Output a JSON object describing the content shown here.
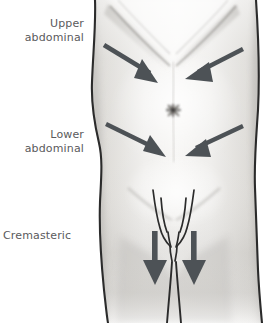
{
  "figure": {
    "background_color": "#ffffff",
    "width": 266,
    "height": 323
  },
  "labels": {
    "upper_abdominal": "Upper\nabdominal",
    "lower_abdominal": "Lower\nabdominal",
    "cremasteric": "Cremasteric",
    "text_color": "#5a5a5c"
  },
  "arrows": {
    "color": "#4d5256",
    "items": [
      {
        "name": "upper-abdominal-left-arrow",
        "direction": "down-right",
        "tail": [
          104,
          45
        ],
        "tip": [
          158,
          83
        ]
      },
      {
        "name": "upper-abdominal-right-arrow",
        "direction": "down-left",
        "tail": [
          243,
          49
        ],
        "tip": [
          186,
          79
        ]
      },
      {
        "name": "lower-abdominal-left-arrow",
        "direction": "down-right",
        "tail": [
          106,
          124
        ],
        "tip": [
          165,
          157
        ]
      },
      {
        "name": "lower-abdominal-right-arrow",
        "direction": "down-left",
        "tail": [
          243,
          126
        ],
        "tip": [
          186,
          155
        ]
      },
      {
        "name": "cremasteric-left-arrow",
        "direction": "down",
        "tail": [
          155,
          232
        ],
        "tip": [
          155,
          285
        ]
      },
      {
        "name": "cremasteric-right-arrow",
        "direction": "down",
        "tail": [
          194,
          232
        ],
        "tip": [
          194,
          285
        ]
      }
    ]
  },
  "anatomy": {
    "navel": "umbilicus",
    "outline_color": "#2c2c2c",
    "skin_tone_light": "#f2f1ef",
    "skin_tone_mid": "#d8d6d3",
    "skin_tone_shadow": "#b4b2ae"
  }
}
